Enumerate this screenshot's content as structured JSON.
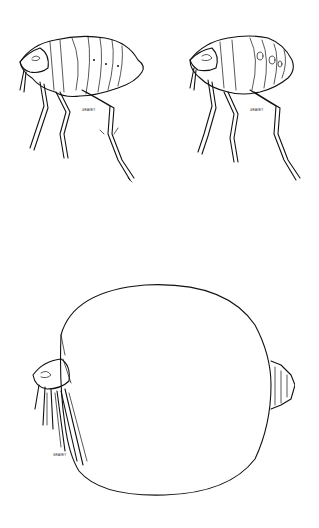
{
  "figures": [
    {
      "id": "flea-male",
      "signature": "GRAVEY"
    },
    {
      "id": "flea-female",
      "signature": "GRAVEY"
    },
    {
      "id": "flea-engorged-female",
      "signature": "GRAVEY"
    }
  ],
  "colors": {
    "background": "#ffffff",
    "ink": "#111111"
  }
}
